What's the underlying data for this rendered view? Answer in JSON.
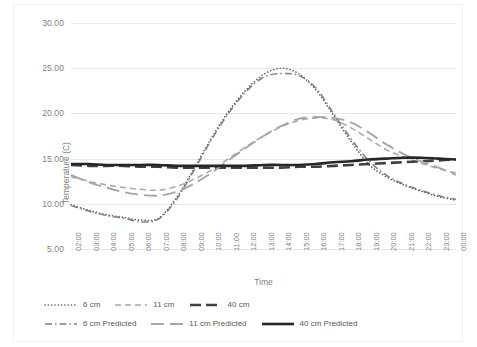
{
  "chart_data": {
    "type": "line",
    "title": "",
    "xlabel": "Time",
    "ylabel": "Temperature (C)",
    "ylim": [
      5.0,
      30.0
    ],
    "yticks": [
      "5.00",
      "10.00",
      "15.00",
      "20.00",
      "25.00",
      "30.00"
    ],
    "ytick_values": [
      5,
      10,
      15,
      20,
      25,
      30
    ],
    "grid": true,
    "legend_position": "bottom",
    "categories": [
      "02:00",
      "03:00",
      "04:00",
      "05:00",
      "06:00",
      "07:00",
      "08:00",
      "09:00",
      "10:00",
      "11:00",
      "12:00",
      "13:00",
      "14:00",
      "15:00",
      "16:00",
      "17:00",
      "18:00",
      "19:00",
      "20:00",
      "21:00",
      "22:00",
      "23:00",
      "00:00"
    ],
    "series": [
      {
        "name": "6 cm",
        "style": "dotted",
        "color": "#595959",
        "values": [
          9.9,
          9.3,
          8.8,
          8.5,
          8.2,
          8.4,
          10.6,
          13.8,
          17.2,
          20.2,
          22.6,
          24.3,
          25.0,
          24.4,
          22.6,
          19.8,
          16.9,
          14.4,
          13.0,
          12.1,
          11.4,
          10.8,
          10.4
        ]
      },
      {
        "name": "11 cm",
        "style": "dashed",
        "color": "#a6a6a6",
        "values": [
          13.0,
          12.5,
          12.1,
          11.8,
          11.6,
          11.5,
          11.9,
          12.7,
          13.7,
          15.0,
          16.3,
          17.5,
          18.5,
          19.2,
          19.5,
          19.3,
          18.4,
          17.2,
          16.0,
          15.2,
          14.5,
          13.9,
          13.4
        ]
      },
      {
        "name": "40 cm",
        "style": "thick-dash",
        "color": "#404040",
        "values": [
          14.3,
          14.2,
          14.2,
          14.2,
          14.1,
          14.1,
          14.0,
          14.0,
          14.0,
          14.0,
          14.0,
          14.0,
          14.0,
          14.1,
          14.1,
          14.2,
          14.3,
          14.4,
          14.5,
          14.6,
          14.7,
          14.8,
          14.9
        ]
      },
      {
        "name": "6 cm Predicted",
        "style": "dash-dot",
        "color": "#808080",
        "values": [
          9.8,
          9.2,
          8.7,
          8.4,
          8.0,
          8.3,
          10.4,
          13.6,
          17.0,
          20.0,
          22.4,
          24.0,
          24.4,
          24.2,
          22.8,
          20.0,
          17.2,
          14.8,
          13.2,
          12.2,
          11.5,
          10.9,
          10.5
        ]
      },
      {
        "name": "11 cm Predicted",
        "style": "long-dash",
        "color": "#a6a6a6",
        "values": [
          13.2,
          12.4,
          11.8,
          11.3,
          11.0,
          10.9,
          11.3,
          12.2,
          13.4,
          14.8,
          16.2,
          17.5,
          18.6,
          19.4,
          19.6,
          19.5,
          19.0,
          17.9,
          16.6,
          15.5,
          14.7,
          14.0,
          13.2
        ]
      },
      {
        "name": "40 cm Predicted",
        "style": "solid-thick",
        "color": "#262626",
        "values": [
          14.4,
          14.4,
          14.3,
          14.3,
          14.3,
          14.3,
          14.2,
          14.2,
          14.2,
          14.2,
          14.2,
          14.3,
          14.3,
          14.3,
          14.4,
          14.6,
          14.7,
          14.9,
          15.0,
          15.1,
          15.1,
          15.0,
          14.9
        ]
      }
    ]
  },
  "legend": {
    "row1": [
      {
        "label": "6 cm",
        "style": "dotted",
        "color": "#595959"
      },
      {
        "label": "11 cm",
        "style": "dashed",
        "color": "#a6a6a6"
      },
      {
        "label": "40 cm",
        "style": "thick-dash",
        "color": "#404040"
      }
    ],
    "row2": [
      {
        "label": "6 cm Predicted",
        "style": "dash-dot",
        "color": "#808080"
      },
      {
        "label": "11 cm Predicted",
        "style": "long-dash",
        "color": "#a6a6a6"
      },
      {
        "label": "40 cm Predicted",
        "style": "solid-thick",
        "color": "#262626"
      }
    ]
  }
}
